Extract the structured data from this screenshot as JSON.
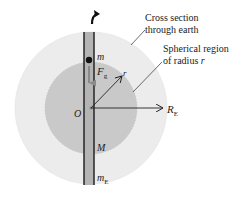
{
  "diagram": {
    "labels": {
      "cross_section_line1": "Cross section",
      "cross_section_line2": "through earth",
      "spherical_line1": "Spherical region",
      "spherical_line2": "of radius ",
      "spherical_var": "r",
      "mass_particle": "m",
      "force_main": "F",
      "force_sub": "g",
      "radius_r": "r",
      "origin": "O",
      "earth_radius_main": "R",
      "earth_radius_sub": "E",
      "inner_mass": "M",
      "earth_mass_main": "m",
      "earth_mass_sub": "E"
    },
    "colors": {
      "outer_sphere": "#ececec",
      "inner_sphere": "#c9c9c9",
      "tunnel_fill": "#b4b4b4",
      "force_arrow": "#8a8a8a",
      "ink": "#222222"
    }
  }
}
